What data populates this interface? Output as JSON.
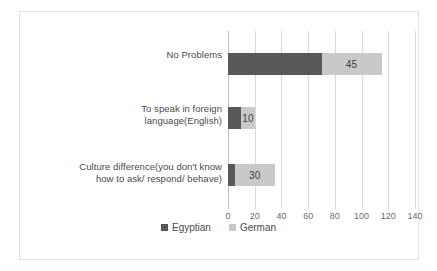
{
  "chart_data": {
    "type": "bar",
    "orientation": "horizontal",
    "stacked": true,
    "title": "",
    "xlabel": "",
    "ylabel": "",
    "xlim": [
      0,
      140
    ],
    "xticks": [
      0,
      20,
      40,
      60,
      80,
      100,
      120,
      140
    ],
    "tick_labels": [
      "0",
      "20",
      "40",
      "60",
      "80",
      "100",
      "120",
      "140"
    ],
    "grid": true,
    "grid_axis": "x",
    "legend_position": "bottom",
    "categories": [
      "No Problems",
      "To speak in foreign language(English)",
      "Culture difference(you don't know how to ask/ respond/ behave)"
    ],
    "category_lines": [
      [
        "No Problems"
      ],
      [
        "To speak in foreign",
        "language(English)"
      ],
      [
        "Culture difference(you don't know",
        "how to ask/ respond/ behave)"
      ]
    ],
    "series": [
      {
        "name": "Egyptian",
        "color": "#58585a",
        "values": [
          70,
          10,
          5
        ],
        "data_labels": [
          "",
          "",
          ""
        ]
      },
      {
        "name": "German",
        "color": "#c9c9c9",
        "values": [
          45,
          10,
          30
        ],
        "data_labels": [
          "45",
          "10",
          "30"
        ]
      }
    ]
  },
  "legend": {
    "items": [
      {
        "label": "Egyptian",
        "color": "#58585a"
      },
      {
        "label": "German",
        "color": "#c9c9c9"
      }
    ]
  },
  "axis": {
    "ticks": [
      "0",
      "20",
      "40",
      "60",
      "80",
      "100",
      "120",
      "140"
    ]
  },
  "colors": {
    "primary": "#58585a",
    "secondary": "#c9c9c9",
    "gridline": "#d9d9d9",
    "frame": "#e2e2e2",
    "text": "#4a4a4a",
    "background": "#ffffff"
  }
}
